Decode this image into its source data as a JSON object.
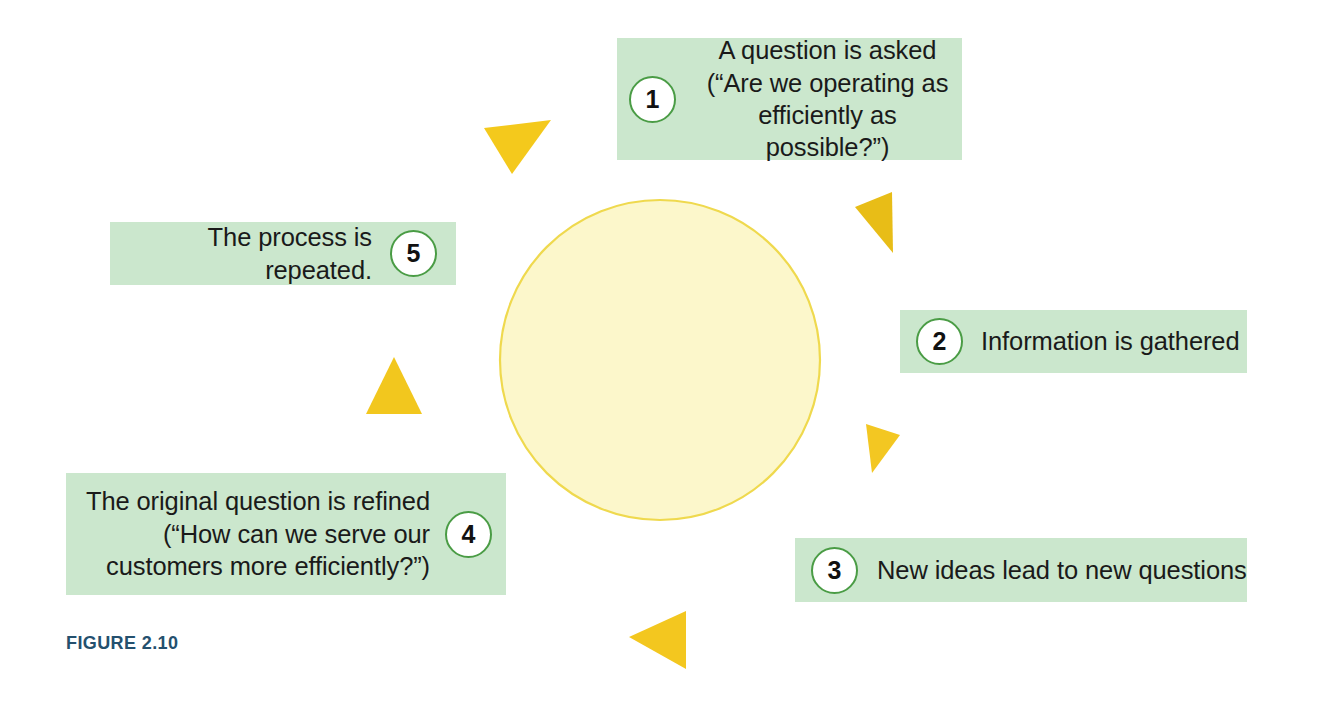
{
  "figure": {
    "caption": "FIGURE 2.10",
    "caption_color": "#24506e",
    "background": "#ffffff"
  },
  "diagram": {
    "type": "cycle",
    "direction": "counter-clockwise",
    "circle": {
      "center_x": 660,
      "center_y": 360,
      "radius": 160,
      "fill": "#fcf7cb",
      "stroke": "#efd94e"
    },
    "arrow_color": "#f3c61f",
    "box_fill": "#cbe7cd",
    "number_ring_color": "#4a9c45",
    "steps": [
      {
        "number": "1",
        "text": "A question is asked\n(“Are we operating as\nefficiently as possible?”)",
        "position": "top"
      },
      {
        "number": "2",
        "text": "Information is gathered",
        "position": "right"
      },
      {
        "number": "3",
        "text": "New ideas lead to new questions",
        "position": "bottom-right"
      },
      {
        "number": "4",
        "text": "The original question is refined\n(“How can we serve our\ncustomers more efficiently?”)",
        "position": "bottom-left"
      },
      {
        "number": "5",
        "text": "The process is repeated.",
        "position": "left"
      }
    ]
  }
}
